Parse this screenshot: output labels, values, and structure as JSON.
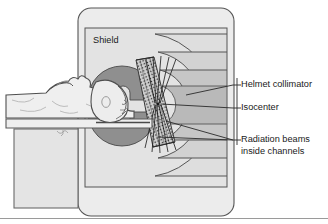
{
  "figure": {
    "width": 328,
    "height": 224,
    "background_color": "#ffffff"
  },
  "colors": {
    "outline": "#4a4a4a",
    "housing_fill": "#e8e8e8",
    "shield_fill": "#dcdcdc",
    "arc_band_light": "#e2e2e2",
    "arc_band_mid": "#d2d2d2",
    "rotor_dark": "#8c8c8c",
    "patient_fill": "#ededed",
    "patient_shade": "#d8d8d8",
    "table_fill": "#e6e6e6",
    "table_base": "#e0e0e0",
    "collimator_fill": "#cfcfcf",
    "beam_line": "#2a2a2a",
    "label_text": "#1a1a1a",
    "leader_line": "#2a2a2a",
    "border_line": "#808080"
  },
  "inline_labels": {
    "shield": "Shield"
  },
  "callouts": [
    {
      "id": "helmet-collimator",
      "text": "Helmet collimator",
      "text_x": 241,
      "text_y": 85,
      "tick_y": 85,
      "leader_target_x": 186,
      "leader_target_y": 95
    },
    {
      "id": "isocenter",
      "text": "Isocenter",
      "text_x": 241,
      "text_y": 108,
      "tick_y": 108,
      "leader_target_x": 160,
      "leader_target_y": 108
    },
    {
      "id": "radiation-beams",
      "text": "Radiation beams",
      "text_x": 241,
      "text_y": 140,
      "tick_y": 140,
      "leader_target_x": 158,
      "leader_target_y": 120
    },
    {
      "id": "radiation-beams-line2",
      "text": "inside channels",
      "text_x": 241,
      "text_y": 152,
      "tick_y": null,
      "leader_target_x": null,
      "leader_target_y": null
    }
  ],
  "leader_rule": {
    "x": 237,
    "y_top": 78,
    "y_bottom": 145
  },
  "diagram_parts": [
    {
      "name": "machine-housing",
      "shape": "rounded-rect",
      "x": 78,
      "y": 8,
      "w": 156,
      "h": 208,
      "radius": 12
    },
    {
      "name": "shield-box",
      "shape": "rect",
      "x": 85,
      "y": 28,
      "w": 142,
      "h": 159
    },
    {
      "name": "rotor-upper",
      "shape": "half-disk",
      "cx": 120,
      "cy": 80,
      "r": 32
    },
    {
      "name": "rotor-lower",
      "shape": "half-disk",
      "cx": 120,
      "cy": 128,
      "r": 32
    },
    {
      "name": "helmet-collimator",
      "shape": "hatched-band"
    },
    {
      "name": "isocenter-core",
      "shape": "disk",
      "cx": 160,
      "cy": 103,
      "r": 18
    },
    {
      "name": "patient-body",
      "shape": "freeform"
    },
    {
      "name": "treatment-table",
      "shape": "rect"
    },
    {
      "name": "table-base",
      "shape": "rect",
      "x": 14,
      "y": 128,
      "w": 64,
      "h": 80
    }
  ]
}
